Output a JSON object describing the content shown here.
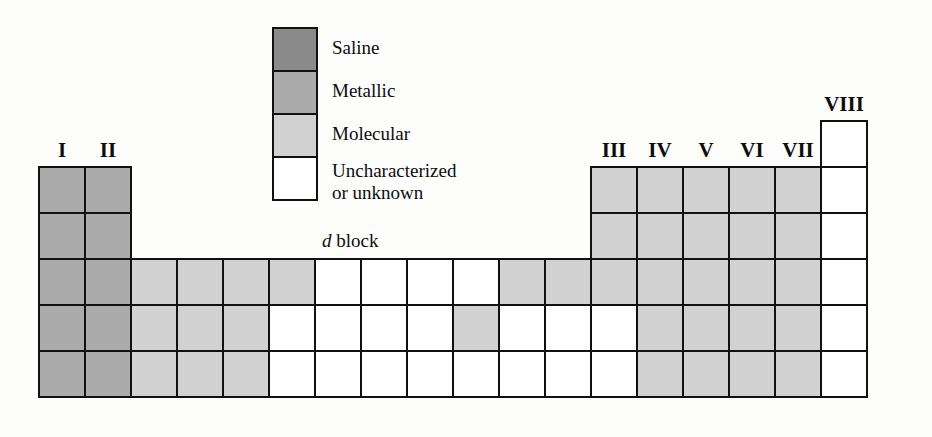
{
  "figure": {
    "kind": "periodic-table-classification-diagram",
    "d_block_caption_italic": "d",
    "d_block_caption_rest": " block"
  },
  "colors": {
    "saline": "#8a8a8a",
    "metallic": "#ababab",
    "molecular": "#d2d2d2",
    "uncharacterized": "#ffffff",
    "border": "#111111",
    "background": "#fdfdfb"
  },
  "legend": {
    "items": [
      {
        "label": "Saline",
        "color_key": "saline",
        "swatch": "#8a8a8a"
      },
      {
        "label": "Metallic",
        "color_key": "metallic",
        "swatch": "#ababab"
      },
      {
        "label": "Molecular",
        "color_key": "molecular",
        "swatch": "#d2d2d2"
      },
      {
        "label": "Uncharacterized\nor unknown",
        "color_key": "uncharacterized",
        "swatch": "#ffffff"
      }
    ]
  },
  "group_headers": [
    {
      "label": "I",
      "column": 1
    },
    {
      "label": "II",
      "column": 2
    },
    {
      "label": "III",
      "column": 13
    },
    {
      "label": "IV",
      "column": 14
    },
    {
      "label": "V",
      "column": 15
    },
    {
      "label": "VI",
      "column": 16
    },
    {
      "label": "VII",
      "column": 17
    },
    {
      "label": "VIII",
      "column": 18
    }
  ],
  "table": {
    "columns": 18,
    "rows": 6,
    "legend_key_order": [
      "empty",
      "saline",
      "metallic",
      "molecular",
      "uncharacterized"
    ],
    "grid": [
      [
        "empty",
        "empty",
        "empty",
        "empty",
        "empty",
        "empty",
        "empty",
        "empty",
        "empty",
        "empty",
        "empty",
        "empty",
        "empty",
        "empty",
        "empty",
        "empty",
        "empty",
        "uncharacterized"
      ],
      [
        "metallic",
        "metallic",
        "empty",
        "empty",
        "empty",
        "empty",
        "empty",
        "empty",
        "empty",
        "empty",
        "empty",
        "empty",
        "molecular",
        "molecular",
        "molecular",
        "molecular",
        "molecular",
        "uncharacterized"
      ],
      [
        "metallic",
        "metallic",
        "empty",
        "empty",
        "empty",
        "empty",
        "empty",
        "empty",
        "empty",
        "empty",
        "empty",
        "empty",
        "molecular",
        "molecular",
        "molecular",
        "molecular",
        "molecular",
        "uncharacterized"
      ],
      [
        "metallic",
        "metallic",
        "molecular",
        "molecular",
        "molecular",
        "molecular",
        "uncharacterized",
        "uncharacterized",
        "uncharacterized",
        "uncharacterized",
        "molecular",
        "molecular",
        "molecular",
        "molecular",
        "molecular",
        "molecular",
        "molecular",
        "uncharacterized"
      ],
      [
        "metallic",
        "metallic",
        "molecular",
        "molecular",
        "molecular",
        "uncharacterized",
        "uncharacterized",
        "uncharacterized",
        "uncharacterized",
        "molecular",
        "uncharacterized",
        "uncharacterized",
        "uncharacterized",
        "molecular",
        "molecular",
        "molecular",
        "molecular",
        "uncharacterized"
      ],
      [
        "metallic",
        "metallic",
        "molecular",
        "molecular",
        "molecular",
        "uncharacterized",
        "uncharacterized",
        "uncharacterized",
        "uncharacterized",
        "uncharacterized",
        "uncharacterized",
        "uncharacterized",
        "uncharacterized",
        "molecular",
        "molecular",
        "molecular",
        "molecular",
        "uncharacterized"
      ]
    ]
  }
}
